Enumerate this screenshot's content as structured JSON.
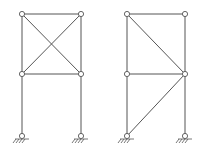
{
  "diagram": {
    "type": "structural-frames",
    "colors": {
      "line": "#555555",
      "background": "#ffffff"
    },
    "frames": [
      {
        "id": "left-frame",
        "columns_x": [
          22,
          81
        ],
        "levels_y": [
          14,
          74
        ],
        "base_y": 136,
        "bracing": "x-brace in upper panel",
        "members": [
          [
            22,
            14,
            81,
            14
          ],
          [
            22,
            74,
            81,
            74
          ],
          [
            22,
            14,
            22,
            136
          ],
          [
            81,
            14,
            81,
            136
          ],
          [
            22,
            14,
            81,
            74
          ],
          [
            81,
            14,
            22,
            74
          ]
        ],
        "joints": [
          [
            22,
            14
          ],
          [
            81,
            14
          ],
          [
            22,
            74
          ],
          [
            81,
            74
          ]
        ],
        "supports": [
          [
            22,
            136
          ],
          [
            81,
            136
          ]
        ]
      },
      {
        "id": "right-frame",
        "columns_x": [
          127,
          185
        ],
        "levels_y": [
          14,
          74
        ],
        "base_y": 136,
        "bracing": "single diagonals in upper and lower panels",
        "members": [
          [
            127,
            14,
            185,
            14
          ],
          [
            127,
            74,
            185,
            74
          ],
          [
            127,
            14,
            127,
            136
          ],
          [
            185,
            14,
            185,
            136
          ],
          [
            127,
            14,
            185,
            74
          ],
          [
            185,
            74,
            127,
            136
          ]
        ],
        "joints": [
          [
            127,
            14
          ],
          [
            185,
            14
          ],
          [
            127,
            74
          ],
          [
            185,
            74
          ]
        ],
        "supports": [
          [
            127,
            136
          ],
          [
            185,
            136
          ]
        ]
      }
    ]
  }
}
